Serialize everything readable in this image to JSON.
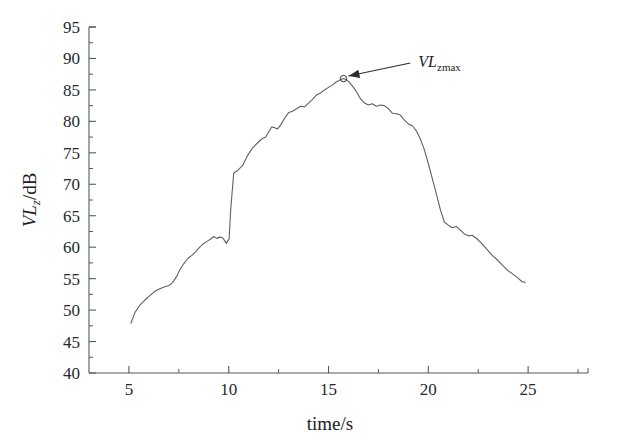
{
  "chart_data": {
    "type": "line",
    "title": "",
    "xlabel": "time/s",
    "ylabel": "VLz/dB",
    "ylabel_parts": {
      "main": "VL",
      "sub": "z",
      "unit": "/dB"
    },
    "xlim": [
      3.0,
      28.0
    ],
    "ylim": [
      40,
      95
    ],
    "grid": false,
    "legend": null,
    "x_ticks_major": [
      5,
      10,
      15,
      20,
      25
    ],
    "x_ticks_major_labels": [
      "5",
      "10",
      "15",
      "20",
      "25"
    ],
    "x_ticks_minor": [
      7.5,
      12.5,
      17.5,
      22.5,
      27.5
    ],
    "y_ticks_major": [
      40,
      45,
      50,
      55,
      60,
      65,
      70,
      75,
      80,
      85,
      90,
      95
    ],
    "y_ticks_major_labels": [
      "40",
      "45",
      "50",
      "55",
      "60",
      "65",
      "70",
      "75",
      "80",
      "85",
      "90",
      "95"
    ],
    "y_ticks_minor": [
      42.5,
      47.5,
      52.5,
      57.5,
      62.5,
      67.5,
      72.5,
      77.5,
      82.5,
      87.5,
      92.5
    ],
    "series": [
      {
        "name": "VLz",
        "color": "#5c6166",
        "x": [
          5.1,
          5.3,
          5.55,
          5.8,
          6.05,
          6.3,
          6.55,
          6.8,
          7.0,
          7.2,
          7.4,
          7.55,
          7.75,
          7.95,
          8.15,
          8.35,
          8.55,
          8.75,
          8.95,
          9.1,
          9.25,
          9.4,
          9.55,
          9.7,
          9.8,
          9.88,
          9.95,
          10.02,
          10.1,
          10.25,
          10.45,
          10.7,
          10.95,
          11.2,
          11.45,
          11.65,
          11.85,
          12.0,
          12.15,
          12.3,
          12.45,
          12.6,
          12.8,
          13.0,
          13.2,
          13.4,
          13.6,
          13.8,
          14.0,
          14.2,
          14.4,
          14.6,
          14.8,
          15.0,
          15.2,
          15.4,
          15.6,
          15.75,
          15.9,
          16.05,
          16.2,
          16.4,
          16.6,
          16.8,
          17.0,
          17.2,
          17.4,
          17.6,
          17.8,
          18.0,
          18.2,
          18.4,
          18.6,
          18.8,
          19.0,
          19.2,
          19.4,
          19.6,
          19.8,
          20.0,
          20.2,
          20.4,
          20.6,
          20.8,
          21.0,
          21.2,
          21.4,
          21.6,
          21.8,
          22.0,
          22.2,
          22.45,
          22.7,
          22.95,
          23.2,
          23.45,
          23.7,
          23.95,
          24.2,
          24.45,
          24.7,
          24.85
        ],
        "y": [
          47.9,
          49.6,
          50.8,
          51.6,
          52.3,
          53.0,
          53.4,
          53.7,
          53.9,
          54.4,
          55.4,
          56.4,
          57.4,
          58.2,
          58.7,
          59.3,
          60.0,
          60.6,
          61.0,
          61.3,
          61.7,
          61.4,
          61.6,
          61.5,
          61.0,
          60.6,
          61.0,
          61.3,
          66.0,
          71.8,
          72.2,
          73.0,
          74.6,
          75.8,
          76.6,
          77.2,
          77.5,
          78.3,
          79.1,
          79.0,
          78.8,
          79.4,
          80.5,
          81.4,
          81.6,
          82.0,
          82.4,
          82.3,
          82.9,
          83.5,
          84.2,
          84.5,
          85.0,
          85.4,
          85.8,
          86.3,
          86.6,
          86.8,
          86.6,
          86.2,
          85.6,
          84.7,
          83.6,
          82.9,
          82.6,
          82.8,
          82.4,
          82.6,
          82.5,
          82.0,
          81.3,
          81.2,
          81.0,
          80.2,
          79.6,
          79.3,
          78.5,
          77.2,
          75.5,
          73.3,
          70.9,
          68.5,
          66.0,
          64.0,
          63.5,
          63.1,
          63.3,
          62.7,
          62.1,
          61.8,
          61.9,
          61.3,
          60.5,
          59.6,
          58.7,
          58.0,
          57.2,
          56.4,
          55.8,
          55.2,
          54.5,
          54.4
        ],
        "max_value": 86.8,
        "max_time": 15.75
      }
    ],
    "annotations": [
      {
        "name": "peak-label",
        "text_main": "VL",
        "text_sub": "zmax",
        "target_x": 15.75,
        "target_y": 86.8,
        "label_x": 19.5,
        "label_y": 89.6
      }
    ]
  }
}
